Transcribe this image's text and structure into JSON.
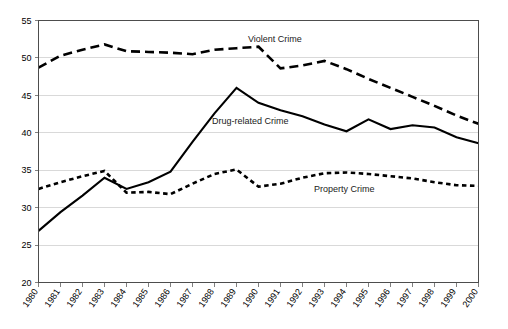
{
  "chart_data": {
    "type": "line",
    "title": "",
    "xlabel": "",
    "ylabel": "",
    "ylim": [
      20,
      55
    ],
    "ytick_step": 5,
    "grid": true,
    "legend": "inline-annotations",
    "categories": [
      "1980",
      "1981",
      "1982",
      "1983",
      "1984",
      "1985",
      "1986",
      "1987",
      "1988",
      "1989",
      "1990",
      "1991",
      "1992",
      "1993",
      "1994",
      "1995",
      "1996",
      "1997",
      "1998",
      "1999",
      "2000"
    ],
    "yticks": [
      "20",
      "25",
      "30",
      "35",
      "40",
      "45",
      "50",
      "55"
    ],
    "series": [
      {
        "name": "Violent Crime",
        "style": "dashed",
        "color": "#000000",
        "values": [
          48.7,
          50.3,
          51.1,
          51.8,
          50.9,
          50.8,
          50.7,
          50.5,
          51.1,
          51.3,
          51.5,
          48.6,
          49.0,
          49.6,
          48.5,
          47.2,
          46.0,
          44.8,
          43.6,
          42.3,
          41.2
        ]
      },
      {
        "name": "Drug-related Crime",
        "style": "solid",
        "color": "#000000",
        "values": [
          26.9,
          29.4,
          31.6,
          34.0,
          32.5,
          33.4,
          34.8,
          38.8,
          42.6,
          46.0,
          44.0,
          43.0,
          42.2,
          41.1,
          40.2,
          41.8,
          40.5,
          41.0,
          40.7,
          39.4,
          38.6
        ]
      },
      {
        "name": "Property Crime",
        "style": "dotted",
        "color": "#000000",
        "values": [
          32.5,
          33.4,
          34.2,
          34.9,
          32.0,
          32.1,
          31.8,
          33.2,
          34.5,
          35.1,
          32.8,
          33.2,
          34.0,
          34.6,
          34.7,
          34.5,
          34.2,
          33.9,
          33.4,
          33.0,
          32.9
        ]
      }
    ],
    "annotations": [
      {
        "text": "Violent Crime",
        "series": "Violent Crime",
        "x_px": 248,
        "y_px": 42
      },
      {
        "text": "Drug-related Crime",
        "series": "Drug-related Crime",
        "x_px": 212,
        "y_px": 124
      },
      {
        "text": "Property Crime",
        "series": "Property Crime",
        "x_px": 314,
        "y_px": 192
      }
    ]
  }
}
